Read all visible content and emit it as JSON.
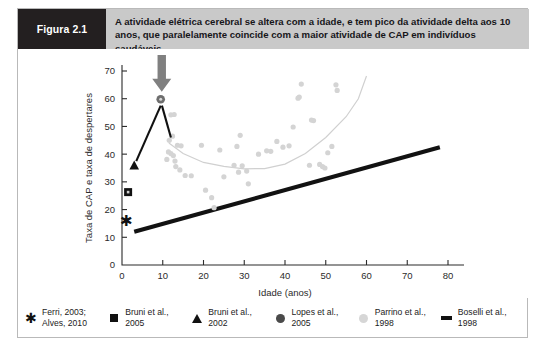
{
  "banner": {
    "tag": "Figura 2.1",
    "caption": "A atividade elétrica cerebral se altera com a idade, e tem pico da atividade delta aos 10 anos, que paralelamente coincide com a maior atividade de CAP em indivíduos saudáveis",
    "tag_bg": "#231f20",
    "bar_bg": "#c9c9c9"
  },
  "legend": {
    "items": [
      {
        "marker": "star-marker",
        "label": "Ferri, 2003;\nAlves, 2010",
        "color": "#111111"
      },
      {
        "marker": "square-marker",
        "label": "Bruni et al.,\n2005",
        "color": "#111111"
      },
      {
        "marker": "triangle-marker",
        "label": "Bruni et al.,\n2002",
        "color": "#111111"
      },
      {
        "marker": "circle-dark-marker",
        "label": "Lopes et al.,\n2005",
        "color": "#4a4a4a"
      },
      {
        "marker": "circle-light-marker",
        "label": "Parrino et al.,\n1998",
        "color": "#d6d6d6"
      },
      {
        "marker": "line-marker",
        "label": "Boselli et al.,\n1998",
        "color": "#111111"
      }
    ]
  },
  "annotations": {
    "arrow": {
      "name": "down-arrow-annotation",
      "color": "#808080",
      "points_to_x": 10,
      "points_to_y": 60
    }
  },
  "chart_data": {
    "type": "scatter",
    "title": "",
    "xlabel": "Idade (anos)",
    "ylabel": "Taxa de CAP e taxa de despertares",
    "xlim": [
      0,
      80
    ],
    "ylim": [
      0,
      70
    ],
    "xticks": [
      0,
      10,
      20,
      30,
      40,
      50,
      60,
      70,
      80
    ],
    "yticks": [
      0,
      10,
      20,
      30,
      40,
      50,
      60,
      70
    ],
    "grid": false,
    "legend_position": "below-plot",
    "series": [
      {
        "name": "Ferri, 2003; Alves, 2010",
        "marker": "star",
        "color": "#111111",
        "points": [
          [
            1.2,
            16
          ]
        ]
      },
      {
        "name": "Bruni et al., 2005",
        "marker": "square",
        "color": "#111111",
        "points": [
          [
            1.5,
            26.3
          ]
        ]
      },
      {
        "name": "Bruni et al., 2002",
        "marker": "triangle",
        "color": "#111111",
        "points": [
          [
            3.0,
            35.8
          ]
        ]
      },
      {
        "name": "Lopes et al., 2005",
        "marker": "circle",
        "color": "#6e6e6e",
        "points": [
          [
            9.5,
            59.8
          ]
        ]
      },
      {
        "name": "Parrino et al., 1998",
        "marker": "circle-light",
        "color": "#d4d4d4",
        "points": [
          [
            12.0,
            54.2
          ],
          [
            12.8,
            54.3
          ],
          [
            11.6,
            45.0
          ],
          [
            12.4,
            46.5
          ],
          [
            11.4,
            40.8
          ],
          [
            12.0,
            40.2
          ],
          [
            12.6,
            39.5
          ],
          [
            11.0,
            38.1
          ],
          [
            13.0,
            37.5
          ],
          [
            13.6,
            43.2
          ],
          [
            14.5,
            43.0
          ],
          [
            13.2,
            35.5
          ],
          [
            14.2,
            34.3
          ],
          [
            15.5,
            32.3
          ],
          [
            17.0,
            32.2
          ],
          [
            19.5,
            43.2
          ],
          [
            20.5,
            27.0
          ],
          [
            22.0,
            24.3
          ],
          [
            22.6,
            20.7
          ],
          [
            24.0,
            41.5
          ],
          [
            25.0,
            31.8
          ],
          [
            27.5,
            36.0
          ],
          [
            28.6,
            33.5
          ],
          [
            29.5,
            35.8
          ],
          [
            30.6,
            33.9
          ],
          [
            29.0,
            46.8
          ],
          [
            28.2,
            42.8
          ],
          [
            31.0,
            29.3
          ],
          [
            33.5,
            40.0
          ],
          [
            35.5,
            41.2
          ],
          [
            36.5,
            41.0
          ],
          [
            38.0,
            44.6
          ],
          [
            39.5,
            42.5
          ],
          [
            41.0,
            43.0
          ],
          [
            42.0,
            49.8
          ],
          [
            43.5,
            60.6
          ],
          [
            43.2,
            60.2
          ],
          [
            44.0,
            65.3
          ],
          [
            46.5,
            52.3
          ],
          [
            47.0,
            52.1
          ],
          [
            48.5,
            36.3
          ],
          [
            49.2,
            35.5
          ],
          [
            49.8,
            35.0
          ],
          [
            51.5,
            42.8
          ],
          [
            52.5,
            65.0
          ],
          [
            52.8,
            63.0
          ],
          [
            50.5,
            40.5
          ],
          [
            46.0,
            36.0
          ]
        ]
      }
    ],
    "trend_curve": {
      "name": "Parrino trend (U-shape)",
      "color": "#d0d0d0",
      "points": [
        [
          11.5,
          44.0
        ],
        [
          15,
          40.2
        ],
        [
          20,
          37.0
        ],
        [
          25,
          35.6
        ],
        [
          30,
          34.7
        ],
        [
          35,
          34.8
        ],
        [
          40,
          36.4
        ],
        [
          45,
          40.2
        ],
        [
          50,
          46.0
        ],
        [
          55,
          53.5
        ],
        [
          58,
          60.0
        ],
        [
          60,
          68.2
        ]
      ]
    },
    "fit_line": {
      "name": "Boselli et al., 1998",
      "color": "#121212",
      "x": [
        3.0,
        78.0
      ],
      "y": [
        12.0,
        42.5
      ]
    },
    "leader_lines": [
      {
        "from": [
          9.5,
          57.5
        ],
        "to": [
          3.5,
          37.5
        ]
      },
      {
        "from": [
          9.8,
          57.5
        ],
        "to": [
          12.0,
          46.0
        ]
      }
    ]
  }
}
